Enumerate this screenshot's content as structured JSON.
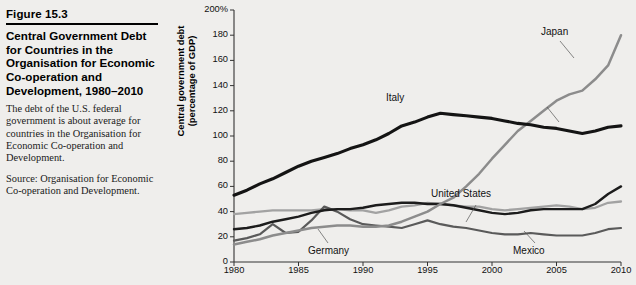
{
  "figure": {
    "number": "Figure 15.3",
    "title": "Central Government Debt for Countries in the Organisation for Economic Co-operation and Development, 1980–2010",
    "description": "The debt of the U.S. federal government is about average for countries in the Organisation for Economic Co-operation and Development.",
    "source": "Source: Organisation for Economic Co-operation and Development."
  },
  "axis": {
    "y_label_line1": "Central government debt",
    "y_label_line2": "(percentage of GDP)",
    "y_ticks": [
      "200%",
      "180",
      "160",
      "140",
      "120",
      "100",
      "80",
      "60",
      "40",
      "20",
      "0"
    ],
    "x_ticks": [
      "1980",
      "1985",
      "1990",
      "1995",
      "2000",
      "2005",
      "2010"
    ]
  },
  "labels": {
    "japan": "Japan",
    "italy": "Italy",
    "united_states": "United States",
    "germany": "Germany",
    "mexico": "Mexico"
  },
  "colors": {
    "background": "#efeeec",
    "italy": "#141414",
    "united_states": "#1c1c1c",
    "japan": "#8c8c8c",
    "germany": "#a2a2a2",
    "mexico": "#5a5a5a",
    "axis": "#333333"
  },
  "chart_data": {
    "type": "line",
    "title": "Central Government Debt for Countries in the Organisation for Economic Co-operation and Development, 1980–2010",
    "xlabel": "",
    "ylabel": "Central government debt (percentage of GDP)",
    "xlim": [
      1980,
      2010
    ],
    "ylim": [
      0,
      200
    ],
    "yticks": [
      0,
      20,
      40,
      60,
      80,
      100,
      120,
      140,
      160,
      180,
      200
    ],
    "xticks": [
      1980,
      1985,
      1990,
      1995,
      2000,
      2005,
      2010
    ],
    "grid": false,
    "legend": "inline-annotations",
    "x": [
      1980,
      1981,
      1982,
      1983,
      1984,
      1985,
      1986,
      1987,
      1988,
      1989,
      1990,
      1991,
      1992,
      1993,
      1994,
      1995,
      1996,
      1997,
      1998,
      1999,
      2000,
      2001,
      2002,
      2003,
      2004,
      2005,
      2006,
      2007,
      2008,
      2009,
      2010
    ],
    "series": [
      {
        "name": "Italy",
        "color": "#141414",
        "values": [
          53,
          57,
          62,
          66,
          71,
          76,
          80,
          83,
          86,
          90,
          93,
          97,
          102,
          108,
          111,
          115,
          118,
          117,
          116,
          115,
          114,
          112,
          110,
          109,
          107,
          106,
          104,
          102,
          104,
          107,
          108
        ]
      },
      {
        "name": "Japan",
        "color": "#8c8c8c",
        "values": [
          14,
          16,
          18,
          21,
          23,
          25,
          27,
          28,
          29,
          29,
          28,
          28,
          29,
          32,
          36,
          40,
          46,
          51,
          60,
          70,
          82,
          93,
          104,
          112,
          120,
          128,
          133,
          136,
          145,
          156,
          180
        ]
      },
      {
        "name": "United States",
        "color": "#1c1c1c",
        "values": [
          26,
          27,
          29,
          32,
          34,
          36,
          39,
          41,
          42,
          42,
          43,
          45,
          46,
          47,
          47,
          46,
          46,
          45,
          43,
          41,
          39,
          38,
          39,
          41,
          42,
          42,
          42,
          42,
          46,
          54,
          60
        ]
      },
      {
        "name": "Germany",
        "color": "#a2a2a2",
        "values": [
          38,
          39,
          40,
          41,
          41,
          41,
          41,
          42,
          42,
          41,
          41,
          39,
          41,
          44,
          45,
          47,
          46,
          45,
          44,
          44,
          42,
          41,
          42,
          43,
          44,
          45,
          44,
          42,
          43,
          47,
          48
        ]
      },
      {
        "name": "Mexico",
        "color": "#5a5a5a",
        "values": [
          17,
          19,
          22,
          30,
          23,
          24,
          33,
          44,
          40,
          34,
          30,
          29,
          28,
          27,
          30,
          33,
          30,
          28,
          27,
          25,
          23,
          22,
          22,
          23,
          22,
          21,
          21,
          21,
          23,
          26,
          27
        ]
      }
    ]
  }
}
